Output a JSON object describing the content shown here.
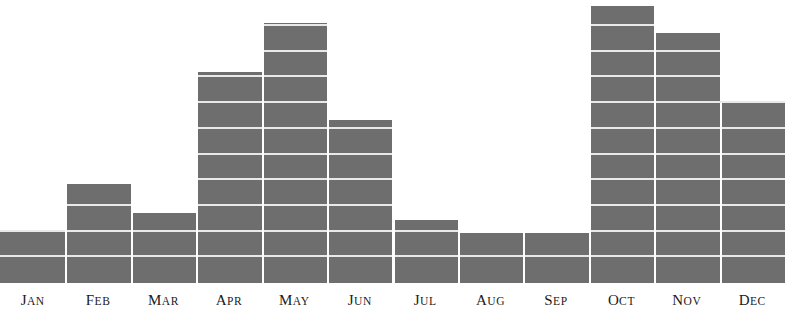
{
  "chart_data": {
    "type": "bar",
    "title": "",
    "subtitle": "",
    "xlabel": "",
    "ylabel": "",
    "grid": true,
    "legend": null,
    "orientation": "vertical",
    "style": "stacked-segment-blocks",
    "bar_color": "#6e6e6e",
    "gridline_color": "#e9e9e9",
    "background_color": "#ffffff",
    "label_color": "#1a1a1a",
    "segment_unit_px": 25.7,
    "baseline_y_px": 283,
    "ylim": [
      0,
      11
    ],
    "categories": [
      "Jan",
      "Feb",
      "Mar",
      "Apr",
      "May",
      "Jun",
      "Jul",
      "Aug",
      "Sep",
      "Oct",
      "Nov",
      "Dec"
    ],
    "values": [
      2,
      3.8,
      2.7,
      8.2,
      10.1,
      6.3,
      2.4,
      1.9,
      1.9,
      10.8,
      9.7,
      7
    ],
    "bars": [
      {
        "label": "Jan",
        "value": 2,
        "top_px": 232,
        "segments": 2
      },
      {
        "label": "Feb",
        "value": 3.8,
        "top_px": 184,
        "segments": 4
      },
      {
        "label": "Mar",
        "value": 2.7,
        "top_px": 213,
        "segments": 3
      },
      {
        "label": "Apr",
        "value": 8.2,
        "top_px": 72,
        "segments": 8
      },
      {
        "label": "May",
        "value": 10.1,
        "top_px": 23,
        "segments": 10
      },
      {
        "label": "Jun",
        "value": 6.3,
        "top_px": 120,
        "segments": 6
      },
      {
        "label": "Jul",
        "value": 2.4,
        "top_px": 220,
        "segments": 2
      },
      {
        "label": "Aug",
        "value": 1.9,
        "top_px": 233,
        "segments": 2
      },
      {
        "label": "Sep",
        "value": 1.9,
        "top_px": 233,
        "segments": 2
      },
      {
        "label": "Oct",
        "value": 10.8,
        "top_px": 6,
        "segments": 11
      },
      {
        "label": "Nov",
        "value": 9.7,
        "top_px": 33,
        "segments": 10
      },
      {
        "label": "Dec",
        "value": 7,
        "top_px": 103,
        "segments": 7
      }
    ]
  }
}
